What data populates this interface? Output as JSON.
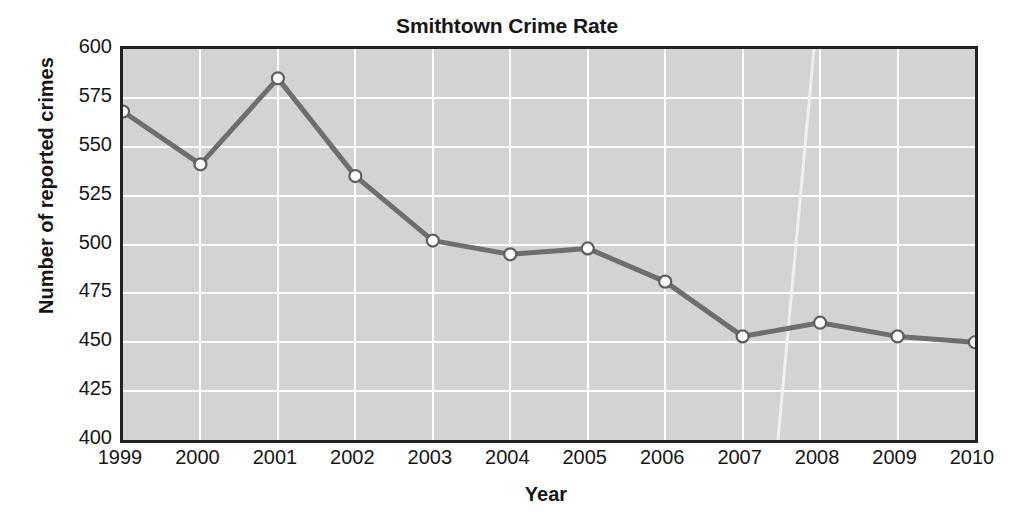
{
  "chart_data": {
    "type": "line",
    "title": "Smithtown Crime Rate",
    "xlabel": "Year",
    "ylabel": "Number of reported crimes",
    "categories": [
      "1999",
      "2000",
      "2001",
      "2002",
      "2003",
      "2004",
      "2005",
      "2006",
      "2007",
      "2008",
      "2009",
      "2010"
    ],
    "values": [
      568,
      541,
      585,
      535,
      502,
      495,
      498,
      481,
      453,
      460,
      453,
      450
    ],
    "series": [
      {
        "name": "Number of reported crimes",
        "values": [
          568,
          541,
          585,
          535,
          502,
          495,
          498,
          481,
          453,
          460,
          453,
          450
        ]
      }
    ],
    "ylim": [
      400,
      600
    ],
    "yticks": [
      "600",
      "575",
      "550",
      "525",
      "500",
      "475",
      "450",
      "425",
      "400"
    ],
    "ytick_values": [
      600,
      575,
      550,
      525,
      500,
      475,
      450,
      425,
      400
    ],
    "xticks": [
      "1999",
      "2000",
      "2001",
      "2002",
      "2003",
      "2004",
      "2005",
      "2006",
      "2007",
      "2008",
      "2009",
      "2010"
    ],
    "grid": true,
    "grid_color": "#ffffff",
    "legend": null,
    "legend_position": "none",
    "plot_background": "#d3d3d3",
    "line_color": "#6e6e6e",
    "marker_fill": "#ffffff",
    "marker_edge": "#5d5d5d",
    "axis_color": "#222222",
    "annotations": []
  }
}
